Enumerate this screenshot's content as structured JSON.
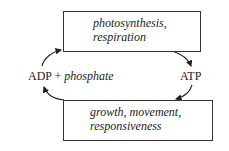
{
  "diagram": {
    "type": "cycle",
    "top_box": {
      "lines": [
        "photosynthesis,",
        "respiration"
      ]
    },
    "bottom_box": {
      "lines": [
        "growth, movement,",
        "responsiveness"
      ]
    },
    "left_label": {
      "main": "ADP",
      "plus": "+",
      "italic": "phosphate"
    },
    "right_label": {
      "main": "ATP"
    },
    "arrows": [
      {
        "from": "left_label",
        "to": "top_box",
        "direction": "up"
      },
      {
        "from": "top_box",
        "to": "right_label",
        "direction": "down"
      },
      {
        "from": "right_label",
        "to": "bottom_box",
        "direction": "down"
      },
      {
        "from": "bottom_box",
        "to": "left_label",
        "direction": "up"
      }
    ]
  }
}
